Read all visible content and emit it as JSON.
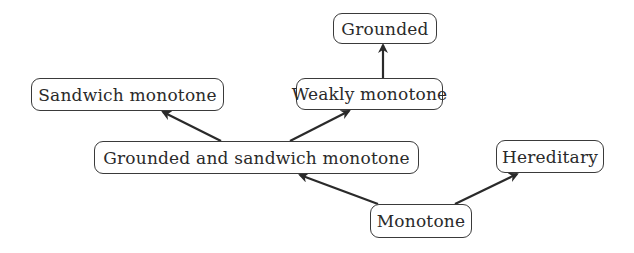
{
  "diagram": {
    "type": "directed-graph",
    "nodes": [
      {
        "id": "grounded",
        "label": "Grounded",
        "x": 333,
        "y": 13,
        "w": 104,
        "h": 31
      },
      {
        "id": "sandwich-monotone",
        "label": "Sandwich monotone",
        "x": 31,
        "y": 78,
        "w": 193,
        "h": 33
      },
      {
        "id": "weakly-monotone",
        "label": "Weakly monotone",
        "x": 296,
        "y": 78,
        "w": 147,
        "h": 32
      },
      {
        "id": "grounded-and-sandwich-monotone",
        "label": "Grounded and sandwich monotone",
        "x": 94,
        "y": 141,
        "w": 325,
        "h": 33
      },
      {
        "id": "hereditary",
        "label": "Hereditary",
        "x": 496,
        "y": 140,
        "w": 108,
        "h": 33
      },
      {
        "id": "monotone",
        "label": "Monotone",
        "x": 370,
        "y": 204,
        "w": 102,
        "h": 34
      }
    ],
    "edges": [
      {
        "from": "weakly-monotone",
        "to": "grounded",
        "x1": 383,
        "y1": 78,
        "x2": 383,
        "y2": 45
      },
      {
        "from": "grounded-and-sandwich-monotone",
        "to": "sandwich-monotone",
        "x1": 221,
        "y1": 141,
        "x2": 163,
        "y2": 112
      },
      {
        "from": "grounded-and-sandwich-monotone",
        "to": "weakly-monotone",
        "x1": 290,
        "y1": 141,
        "x2": 349,
        "y2": 111
      },
      {
        "from": "monotone",
        "to": "grounded-and-sandwich-monotone",
        "x1": 378,
        "y1": 204,
        "x2": 300,
        "y2": 175
      },
      {
        "from": "monotone",
        "to": "hereditary",
        "x1": 455,
        "y1": 204,
        "x2": 517,
        "y2": 174
      }
    ],
    "colors": {
      "stroke": "#2a2a2a",
      "text": "#2a2a2a",
      "background": "#ffffff"
    }
  }
}
